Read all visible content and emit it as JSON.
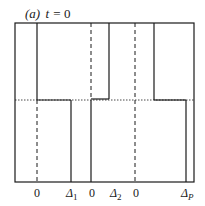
{
  "title": {
    "panel": "(a)",
    "variable": "t",
    "equals": "=",
    "value": "0"
  },
  "x_labels": [
    {
      "text": "0",
      "sub": ""
    },
    {
      "text": "Δ",
      "sub": "1"
    },
    {
      "text": "0",
      "sub": ""
    },
    {
      "text": "Δ",
      "sub": "2"
    },
    {
      "text": "0",
      "sub": ""
    },
    {
      "text": "Δ",
      "sub": "P"
    }
  ],
  "colors": {
    "line": "#1a1a1a",
    "background": "#ffffff"
  }
}
